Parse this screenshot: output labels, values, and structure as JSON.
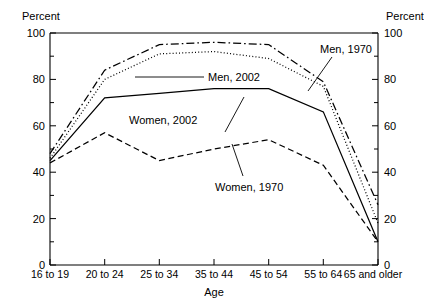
{
  "chart_data": {
    "type": "line",
    "title": "",
    "xlabel": "Age",
    "ylabel": "Percent",
    "ylabel_right": "Percent",
    "ylim": [
      0,
      100
    ],
    "yticks": [
      0,
      20,
      40,
      60,
      80,
      100
    ],
    "yticks_minor": [
      10,
      30,
      50,
      70,
      90
    ],
    "ytick_labels": [
      "0",
      "20",
      "40",
      "60",
      "80",
      "100"
    ],
    "grid": false,
    "legend_position": "inline-annotations",
    "categories": [
      "16 to 19",
      "20 to 24",
      "25 to 34",
      "35 to 44",
      "45 to 54",
      "55 to 64",
      "65 and older"
    ],
    "series": [
      {
        "name": "Men, 1970",
        "style": "dash-dot",
        "values": [
          48,
          84,
          95,
          96,
          95,
          79,
          26
        ]
      },
      {
        "name": "Men, 2002",
        "style": "dotted",
        "values": [
          46,
          80,
          91,
          92,
          89,
          77,
          18
        ]
      },
      {
        "name": "Women, 2002",
        "style": "solid",
        "values": [
          45,
          72,
          74,
          76,
          76,
          66,
          10
        ]
      },
      {
        "name": "Women, 1970",
        "style": "dashed",
        "values": [
          44,
          57,
          45,
          50,
          54,
          43,
          10
        ]
      }
    ],
    "annotations": [
      {
        "text": "Men, 1970",
        "series": "Men, 1970"
      },
      {
        "text": "Men, 2002",
        "series": "Men, 2002"
      },
      {
        "text": "Women, 2002",
        "series": "Women, 2002"
      },
      {
        "text": "Women, 1970",
        "series": "Women, 1970"
      }
    ]
  },
  "axis": {
    "left_title": "Percent",
    "right_title": "Percent",
    "x_title": "Age"
  },
  "ticks": {
    "y": [
      "100",
      "80",
      "60",
      "40",
      "20",
      "0"
    ]
  },
  "labels": {
    "men_1970": "Men, 1970",
    "men_2002": "Men, 2002",
    "women_2002": "Women, 2002",
    "women_1970": "Women, 1970",
    "cat0": "16 to 19",
    "cat1": "20 to 24",
    "cat2": "25 to 34",
    "cat3": "35 to 44",
    "cat4": "45 to 54",
    "cat5": "55 to 64",
    "cat6": "65 and older"
  }
}
